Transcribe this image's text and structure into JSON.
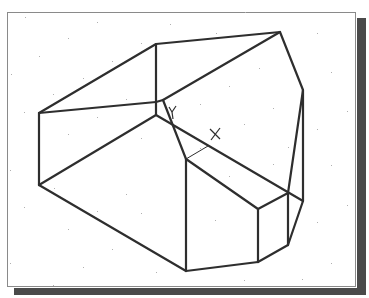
{
  "drawing": {
    "description": "CAD wireframe isometric view of a faceted solid with grid dots, UCS icon and cursor marker",
    "colors": {
      "background": "#ffffff",
      "line": "#2e2e2e",
      "frame_border": "#8a8a8a",
      "shadow": "#4a4a4a",
      "grid_dot": "#b0b0b0"
    },
    "ucs_icon": {
      "label": "Y",
      "x": 170,
      "y": 113
    },
    "cursor_marker": {
      "label": "×",
      "x": 215,
      "y": 135
    }
  }
}
